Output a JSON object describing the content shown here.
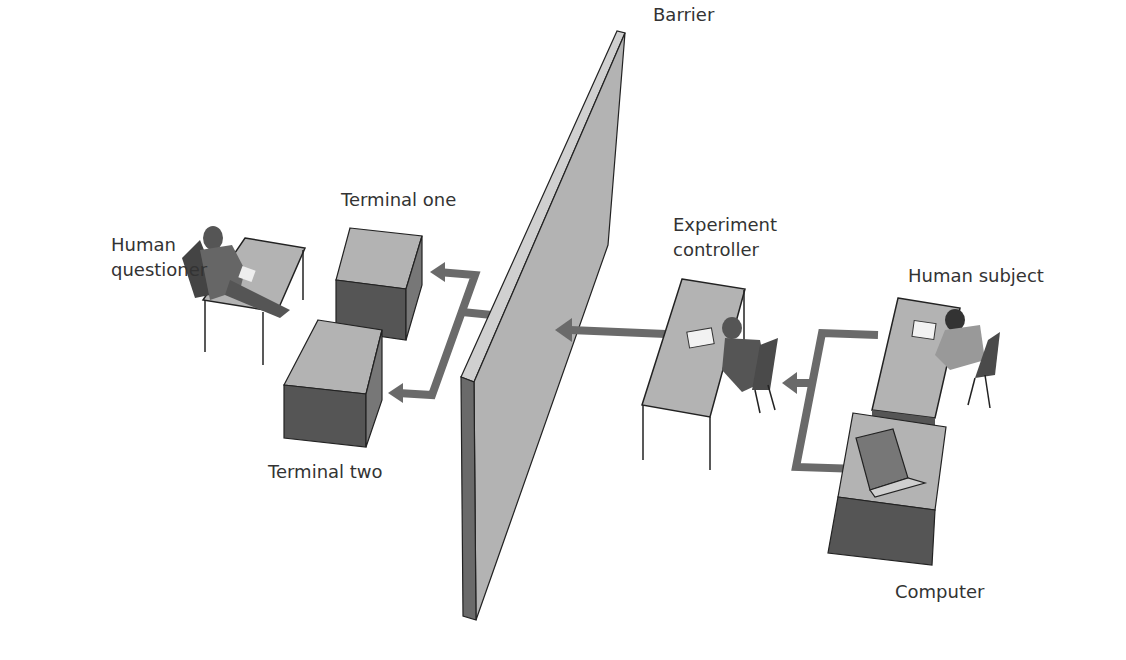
{
  "diagram": {
    "type": "turing-test-setup",
    "labels": {
      "barrier": "Barrier",
      "terminal_one": "Terminal one",
      "terminal_two": "Terminal two",
      "human_questioner_line1": "Human",
      "human_questioner_line2": "questioner",
      "experiment_controller_line1": "Experiment",
      "experiment_controller_line2": "controller",
      "human_subject": "Human subject",
      "computer": "Computer"
    },
    "colors": {
      "surface_light": "#b3b3b3",
      "surface_dark": "#555555",
      "arrow": "#6a6a6a",
      "outline": "#222222"
    }
  }
}
